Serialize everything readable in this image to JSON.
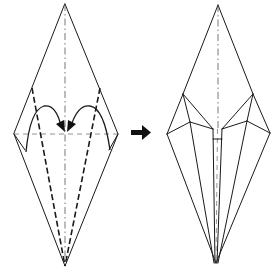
{
  "diagram": {
    "type": "origami-instruction",
    "colors": {
      "line": "#1a1a1a",
      "background": "#ffffff",
      "arrow": "#111111"
    },
    "steps": [
      {
        "id": "before",
        "label": "Before fold",
        "outline": [
          [
            65,
            4
          ],
          [
            118,
            134
          ],
          [
            65,
            266
          ],
          [
            14,
            134
          ]
        ],
        "center_crease": {
          "from": [
            65,
            4
          ],
          "to": [
            65,
            266
          ],
          "style": "mountain"
        },
        "horizontal_crease": {
          "from": [
            14,
            134
          ],
          "to": [
            118,
            134
          ],
          "style": "guide"
        },
        "valley_folds": [
          {
            "from": [
              32,
              88
            ],
            "to": [
              65,
              266
            ]
          },
          {
            "from": [
              100,
              88
            ],
            "to": [
              65,
              266
            ]
          }
        ],
        "lower_edges": [
          {
            "from": [
              14,
              134
            ],
            "to": [
              25,
              148
            ]
          },
          {
            "from": [
              118,
              134
            ],
            "to": [
              109,
              150
            ]
          }
        ],
        "fold_arrows": [
          {
            "from": [
              26,
              150
            ],
            "control": [
              40,
              98
            ],
            "to": [
              62,
              132
            ],
            "direction": "right"
          },
          {
            "from": [
              108,
              150
            ],
            "control": [
              92,
              98
            ],
            "to": [
              68,
              132
            ],
            "direction": "left"
          }
        ]
      },
      {
        "id": "after",
        "label": "After fold",
        "outline": [
          [
            218,
            5
          ],
          [
            270,
            133
          ],
          [
            216,
            263
          ],
          [
            167,
            134
          ]
        ],
        "center_crease": {
          "from": [
            218,
            5
          ],
          "to": [
            218,
            129
          ],
          "style": "mountain"
        },
        "inner_points": {
          "left_upper": [
            183,
            94
          ],
          "left_mid": [
            190,
            122
          ],
          "center_left": [
            213,
            129
          ],
          "right_upper": [
            253,
            94
          ],
          "right_mid": [
            247,
            121
          ],
          "center_right": [
            222,
            129
          ]
        },
        "center_strip": {
          "x_left": 213,
          "x_right": 222,
          "top": 129,
          "bottom": 263
        }
      }
    ],
    "step_arrow": {
      "direction": "right",
      "meaning": "becomes",
      "position": [
        130,
        132
      ]
    }
  }
}
